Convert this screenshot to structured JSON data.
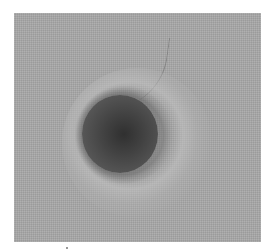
{
  "image": {
    "description": "Grayscale photograph of a dark circular spot surrounded by a lighter halo ring on a textured gray background",
    "colors": {
      "background": "#a9a9a9",
      "spot_center": "#303030",
      "spot_edge": "#6a6a6a",
      "halo": "#c3c3c3",
      "page": "#ffffff"
    }
  }
}
